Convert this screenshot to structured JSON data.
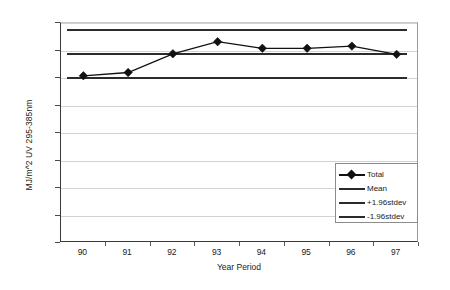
{
  "chart_data": {
    "type": "line",
    "title": "",
    "xlabel": "Year Period",
    "ylabel": "MJ/m^2 UV 295-385nm",
    "categories": [
      "90",
      "91",
      "92",
      "93",
      "94",
      "95",
      "96",
      "97"
    ],
    "x": [
      90,
      91,
      92,
      93,
      94,
      95,
      96,
      97
    ],
    "xlim": [
      89.5,
      97.5
    ],
    "ylim": [
      0.0,
      400.0
    ],
    "ytick_labels": [
      "400.00",
      "350.00",
      "300.00",
      "250.00",
      "200.00",
      "150.00",
      "100.00",
      "50.00",
      "0.00"
    ],
    "ytick_values": [
      400,
      350,
      300,
      250,
      200,
      150,
      100,
      50,
      0
    ],
    "ytick_interval": 50,
    "grid": true,
    "grid_axis": "y",
    "legend_position": "inside-bottom-right",
    "series": [
      {
        "name": "Total",
        "type": "line-marker",
        "marker": "diamond",
        "color": "#111111",
        "values": [
          304.0,
          310.0,
          344.0,
          366.0,
          354.0,
          354.0,
          358.0,
          343.0
        ]
      },
      {
        "name": "Mean",
        "type": "reference-line",
        "color": "#2b2b2b",
        "value": 344.0
      },
      {
        "name": "+1.96stdev",
        "type": "reference-line",
        "color": "#2b2b2b",
        "value": 387.0
      },
      {
        "name": "-1.96stdev",
        "type": "reference-line",
        "color": "#2b2b2b",
        "value": 300.0
      }
    ],
    "legend": [
      {
        "label": "Total",
        "marker": "diamond",
        "has_marker": true,
        "color": "#111111"
      },
      {
        "label": "Mean",
        "marker": "none",
        "has_marker": false,
        "color": "#2b2b2b"
      },
      {
        "label": "+1.96stdev",
        "marker": "none",
        "has_marker": false,
        "color": "#2b2b2b"
      },
      {
        "label": "-1.96stdev",
        "marker": "none",
        "has_marker": false,
        "color": "#2b2b2b"
      }
    ]
  },
  "colors": {
    "series_line": "#111111",
    "reference_line": "#2b2b2b",
    "gridline": "#d2d2d2",
    "axis": "#3a3a3a",
    "background": "#ffffff",
    "text": "#1a1a1a"
  }
}
